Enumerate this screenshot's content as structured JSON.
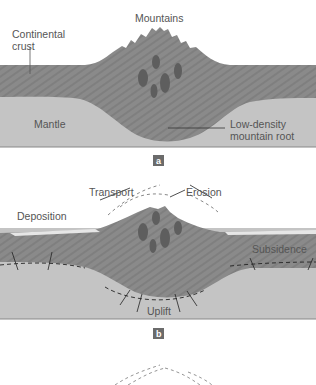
{
  "panel_a": {
    "labels": {
      "mountains": "Mountains",
      "continental_crust_1": "Continental",
      "continental_crust_2": "crust",
      "mantle": "Mantle",
      "root_1": "Low-density",
      "root_2": "mountain root"
    },
    "tag": "a"
  },
  "panel_b": {
    "labels": {
      "transport": "Transport",
      "erosion": "Erosion",
      "deposition": "Deposition",
      "subsidence": "Subsidence",
      "uplift": "Uplift"
    },
    "tag": "b"
  },
  "colors": {
    "crust": "#8a8a8a",
    "mantle": "#c4c4c4",
    "intrusion": "#5e5e5e",
    "sediment": "#e6e6e6",
    "tag_bg": "#6b6b6b",
    "text": "#555555"
  }
}
